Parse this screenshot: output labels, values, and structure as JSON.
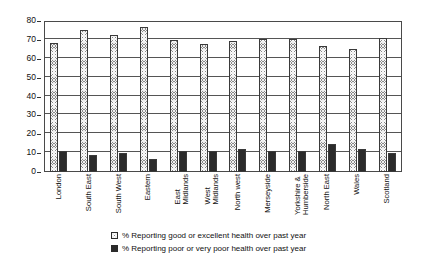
{
  "chart_data": {
    "type": "bar",
    "title": "",
    "subtitle": "",
    "xlabel": "",
    "ylabel": "",
    "ylim": [
      0,
      80
    ],
    "ytick_step": 10,
    "yticks": [
      "0",
      "10",
      "20",
      "30",
      "40",
      "50",
      "60",
      "70",
      "80"
    ],
    "grid": true,
    "legend_position": "bottom",
    "categories": [
      "London",
      "South East",
      "South West",
      "Eastern",
      "East\nMidlands",
      "West\nMidlands",
      "North west",
      "Merseyside",
      "Yorkshire &\nHumberside",
      "North East",
      "Wales",
      "Scotland"
    ],
    "series": [
      {
        "name": "% Reporting good or excellent health over past year",
        "pattern": "crosshatch",
        "color": "#8a8a8a",
        "values": [
          68.5,
          75,
          72.5,
          77,
          70,
          68,
          69.5,
          70.5,
          70.5,
          66.5,
          65,
          71
        ]
      },
      {
        "name": "% Reporting poor or very poor health over past year",
        "pattern": "solid",
        "color": "#2b2b2b",
        "values": [
          11,
          9,
          10,
          7,
          11,
          11,
          12,
          11,
          11,
          15,
          12,
          10
        ]
      }
    ]
  },
  "legend": {
    "items": [
      {
        "label": "% Reporting good or excellent health over past year",
        "swatch": "crosshatch-square-icon"
      },
      {
        "label": "% Reporting poor or very poor health over past year",
        "swatch": "solid-square-icon"
      }
    ]
  }
}
